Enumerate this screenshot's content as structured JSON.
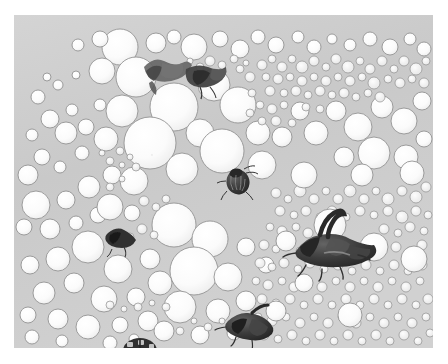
{
  "image": {
    "kind": "photograph",
    "subject": "dense field of round bubbles (foam) with several dark insects resting on the surface",
    "style": "grayscale macro photograph",
    "alt_text": "Grayscale macro photograph of a dense bubble raft with several dark beetles scattered across it",
    "frame": {
      "canvas_width": 448,
      "canvas_height": 364,
      "plate_left": 14,
      "plate_top": 15,
      "plate_width": 419,
      "plate_height": 333,
      "margin_color": "#ffffff"
    },
    "palette": {
      "background_gray": "#c9c9c9",
      "background_gray_light": "#d6d6d6",
      "background_gray_dark": "#bdbdbd",
      "bubble_fill": "#fbfbfb",
      "bubble_fill_soft": "#f2f2f2",
      "bubble_outline": "#8d8d8d",
      "bubble_outline_dark": "#6f6f6f",
      "insect_dark": "#2a2a2a",
      "insect_mid": "#4f4f4f",
      "insect_light": "#7a7a7a",
      "margin": "#ffffff"
    },
    "caption": "",
    "subjects": [
      {
        "name": "insect-top-left",
        "label": "moth-like insect",
        "x": 152,
        "y": 58,
        "size": 34
      },
      {
        "name": "insect-top-right",
        "label": "dark winged insect",
        "x": 190,
        "y": 64,
        "size": 30
      },
      {
        "name": "insect-center-beetle",
        "label": "striped beetle",
        "x": 238,
        "y": 180,
        "size": 22
      },
      {
        "name": "insect-left-small",
        "label": "small dark insect",
        "x": 113,
        "y": 233,
        "size": 20
      },
      {
        "name": "insect-right-large",
        "label": "large beetle with curved tail",
        "x": 325,
        "y": 243,
        "size": 42
      },
      {
        "name": "insect-bottom-center",
        "label": "dark elongated insect",
        "x": 248,
        "y": 325,
        "size": 30
      },
      {
        "name": "insect-bottom-ladybug",
        "label": "spotted ladybird beetle",
        "x": 140,
        "y": 352,
        "size": 24
      }
    ],
    "bubble_clusters": [
      {
        "name": "upper-left-sparse",
        "density": "sparse",
        "mean_radius": 16
      },
      {
        "name": "upper-right-dense-foam",
        "density": "very dense",
        "mean_radius": 5
      },
      {
        "name": "center-large-bubbles",
        "density": "medium",
        "mean_radius": 22
      },
      {
        "name": "lower-right-fine-foam",
        "density": "very dense",
        "mean_radius": 6
      },
      {
        "name": "lower-left-medium",
        "density": "medium",
        "mean_radius": 14
      }
    ],
    "counts": {
      "approx_bubbles": 900,
      "insects": 7
    }
  }
}
